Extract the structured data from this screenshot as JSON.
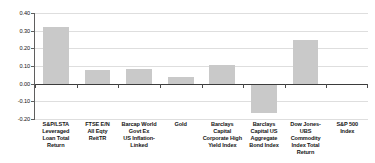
{
  "chart_data": {
    "type": "bar",
    "title": "",
    "subtitle": "",
    "xlabel": "",
    "ylabel": "",
    "ylim": [
      -0.2,
      0.4
    ],
    "ytick_labels": [
      "0.40",
      "0.30",
      "0.20",
      "0.10",
      "0.00",
      "-0.10",
      "-0.20"
    ],
    "ytick_values": [
      0.4,
      0.3,
      0.2,
      0.1,
      0.0,
      -0.1,
      -0.2
    ],
    "grid": true,
    "legend": "none",
    "bar_color": "#c9c9c9",
    "zero_line_color": "#3b3b3b",
    "gridline_color": "#dedede",
    "categories": [
      "S&P/LSTA Leveraged Loan Total Return",
      "FTSE E/N All Eqty ReitTR",
      "Barcap World Govt Ex US Inflation-Linked",
      "Gold",
      "Barclays Capital Corporate High Yield Index",
      "Barclays Capital US Aggregate Bond Index",
      "Dow Jones-UBS Commodity Index Total Return",
      "S&P 500 Index"
    ],
    "category_lines": [
      [
        "S&P/LSTA",
        "Leveraged",
        "Loan Total",
        "Return"
      ],
      [
        "FTSE E/N",
        "All Eqty",
        "ReitTR"
      ],
      [
        "Barcap World",
        "Govt Ex",
        "US Inflation-",
        "Linked"
      ],
      [
        "Gold"
      ],
      [
        "Barclays Capital",
        "Corporate High",
        "Yield Index"
      ],
      [
        "Barclays",
        "Capital US",
        "Aggregate",
        "Bond Index"
      ],
      [
        "Dow Jones-UBS",
        "Commodity",
        "Index Total",
        "Return"
      ],
      [
        "S&P 500",
        "Index"
      ]
    ],
    "values": [
      0.32,
      0.075,
      0.085,
      0.04,
      0.105,
      -0.165,
      0.25,
      0.0
    ]
  }
}
